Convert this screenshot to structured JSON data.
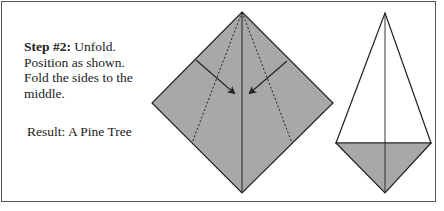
{
  "instructions": {
    "step_label": "Step #2:",
    "step_text": " Unfold. Position as shown. Fold the sides to the middle.",
    "result": "Result: A Pine Tree"
  },
  "diagrams": [
    {
      "name": "folded-square",
      "fill": "#a8a8a8",
      "stroke": "#222222"
    },
    {
      "name": "pine-tree-result",
      "fill": "#a8a8a8",
      "stroke": "#222222"
    }
  ]
}
